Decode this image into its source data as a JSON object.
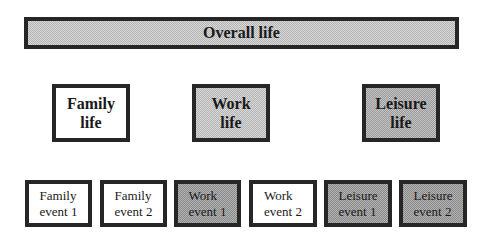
{
  "diagram": {
    "top": {
      "label": "Overall life",
      "fill": "light"
    },
    "domains": [
      {
        "line1": "Family",
        "line2": "life",
        "fill": "white"
      },
      {
        "line1": "Work",
        "line2": "life",
        "fill": "light"
      },
      {
        "line1": "Leisure",
        "line2": "life",
        "fill": "dark"
      }
    ],
    "events": [
      {
        "line1": "Family",
        "line2": "event 1",
        "fill": "white"
      },
      {
        "line1": "Family",
        "line2": "event 2",
        "fill": "white"
      },
      {
        "line1": "Work",
        "line2": "event 1",
        "fill": "dark"
      },
      {
        "line1": "Work",
        "line2": "event 2",
        "fill": "white"
      },
      {
        "line1": "Leisure",
        "line2": "event 1",
        "fill": "dark"
      },
      {
        "line1": "Leisure",
        "line2": "event 2",
        "fill": "dark"
      }
    ]
  }
}
